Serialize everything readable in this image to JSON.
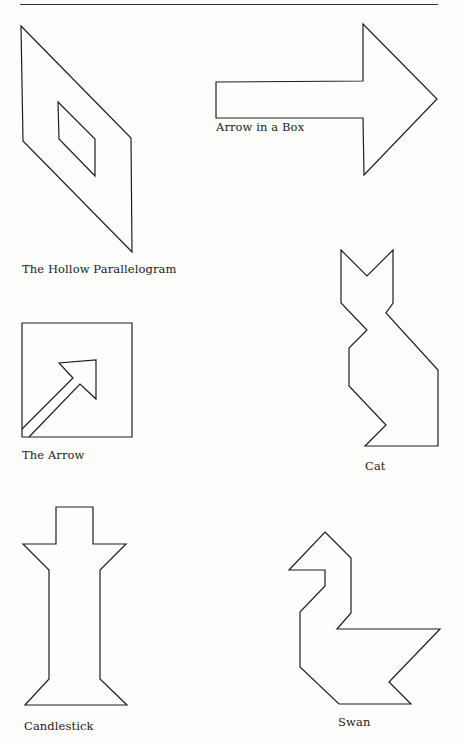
{
  "page": {
    "header_rule": true,
    "figures": [
      {
        "id": "hollow-parallelogram",
        "caption": "The Hollow Parallelogram",
        "caption_pos": [
          22,
          262
        ],
        "outline": "21,26 131,138 132,252 23,141",
        "inner": "58,102 95,139 95,176 59,139"
      },
      {
        "id": "arrow-in-a-box",
        "caption": "Arrow in a Box",
        "caption_pos": [
          216,
          120
        ],
        "outline": "216,82 363,81 363,24 437,99 364,175 363,118 216,118"
      },
      {
        "id": "the-arrow",
        "caption": "The Arrow",
        "caption_pos": [
          22,
          448
        ],
        "box": "22,323 132,323 132,437 22,437",
        "arrow": "22,429 73,378 59,363 96,360 96,399 80,384 29,437"
      },
      {
        "id": "cat",
        "caption": "Cat",
        "caption_pos": [
          365,
          459
        ],
        "outline": "341,250 367,276 393,250 393,303 386,313 438,370 438,446 365,446 386,425 349,386 349,348 367,330 341,303"
      },
      {
        "id": "candlestick",
        "caption": "Candlestick",
        "caption_pos": [
          24,
          719
        ],
        "outline": "56,507 93,507 93,544 126,544 100,570 100,679 127,705 25,705 49,679 49,570 23,544 56,544"
      },
      {
        "id": "swan",
        "caption": "Swan",
        "caption_pos": [
          338,
          715
        ],
        "outline": "325,532 351,558 351,613 337,629 440,629 389,682 411,704 339,704 300,667 300,612 325,586 325,570 289,570"
      }
    ]
  }
}
